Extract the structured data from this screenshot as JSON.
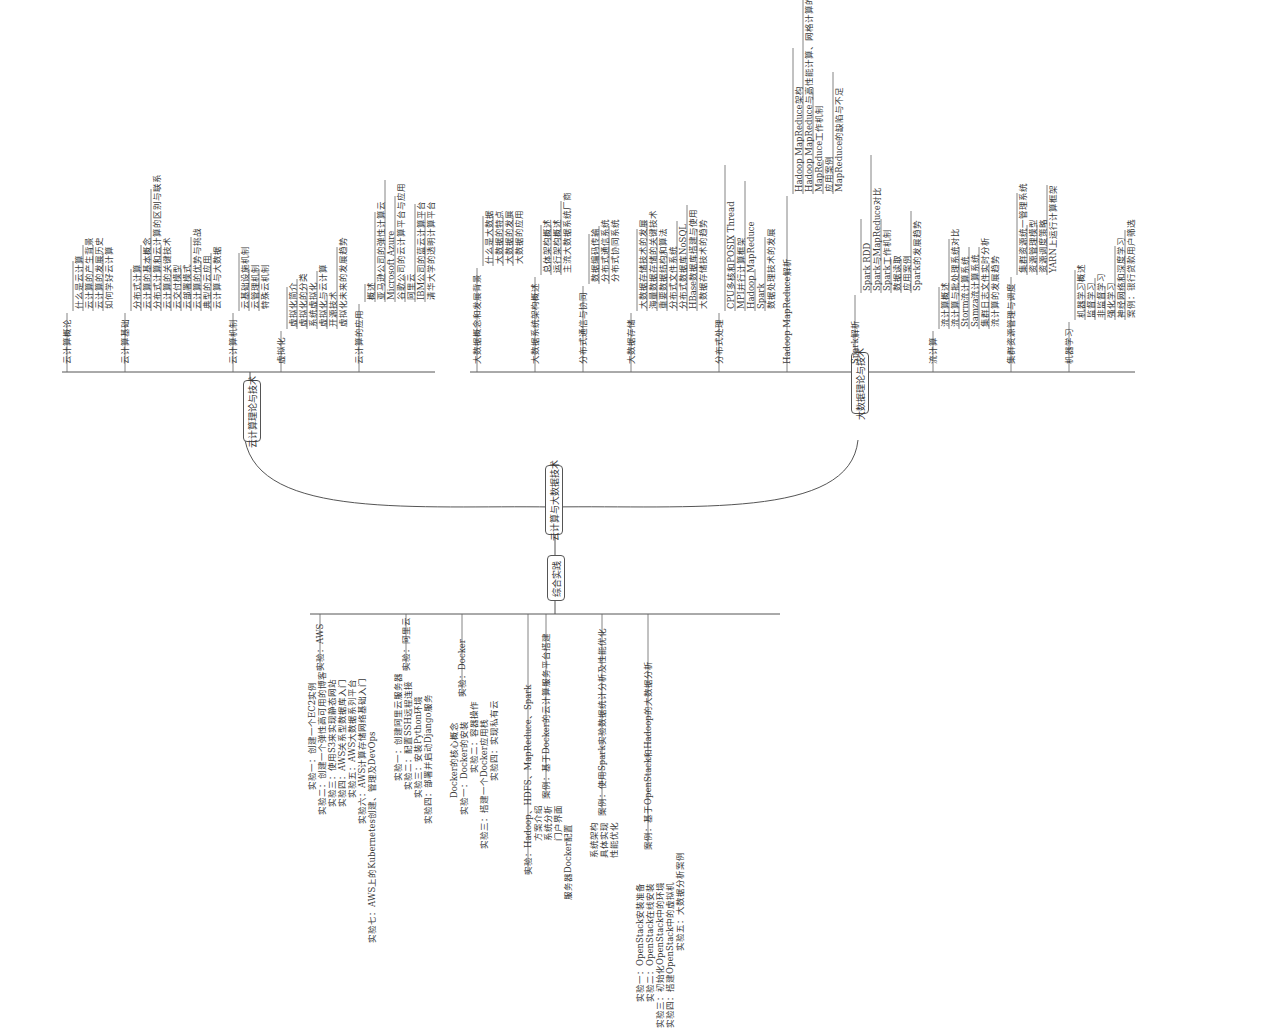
{
  "root": {
    "label": "云计算与大数据技术"
  },
  "left_hub": {
    "label": "云计算理论与技术"
  },
  "right_hub": {
    "label": "大数据理论与技术"
  },
  "bottom_hub": {
    "label": "综合实践"
  },
  "cloud_theory": [
    {
      "label": "云计算概论",
      "children": [
        "什么是云计算",
        "云计算的产生背景",
        "云计算的发展历史",
        "如何学好云计算"
      ]
    },
    {
      "label": "云计算基础",
      "children": [
        "分布式计算",
        "云计算的基本概念",
        "分布式计算和云计算的区别与联系",
        "云计算的关键技术",
        "云交付模型",
        "云部署模式",
        "云计算的优势与挑战",
        "典型的云应用",
        "云计算与大数据"
      ]
    },
    {
      "label": "云计算机制",
      "children": [
        "云基础设施机制",
        "云管理机制",
        "特殊云机制"
      ]
    },
    {
      "label": "虚拟化",
      "children": [
        "虚拟化简介",
        "虚拟化的分类",
        "系统虚拟化",
        "虚拟化与云计算",
        "开源技术",
        "虚拟化未来的发展趋势"
      ]
    },
    {
      "label": "云计算的应用",
      "children": [
        "概述",
        "亚马逊公司的弹性计算云",
        "Microsoft Azure",
        "谷歌公司的云计算平台与应用",
        "阿里云",
        "IBM公司的蓝云计算平台",
        "清华大学的透明计算平台"
      ]
    }
  ],
  "bigdata_theory": [
    {
      "label": "大数据概念和发展背景",
      "children": [
        "什么是大数据",
        "大数据的特点",
        "大数据的发展",
        "大数据的应用"
      ]
    },
    {
      "label": "大数据系统架构概述",
      "children": [
        "总体架构概述",
        "运行架构概述",
        "主流大数据系统厂商"
      ]
    },
    {
      "label": "分布式通信与协同",
      "children": [
        "数据编码传输",
        "分布式通信系统",
        "分布式协同系统"
      ]
    },
    {
      "label": "大数据存储",
      "children": [
        "大数据存储技术的发展",
        "海量数据存储的关键技术",
        "重要数据结构和算法",
        "分布式文件系统",
        "分布式数据库NoSQL",
        "HBase数据库搭建与使用",
        "大数据存储技术的趋势"
      ]
    },
    {
      "label": "分布式处理",
      "children": [
        "CPU多核和POSIX Thread",
        "MPI并行计算框架",
        "Hadoop MapReduce",
        "Spark",
        "数据处理技术的发展"
      ]
    },
    {
      "label": "Hadoop MapReduce解析",
      "children": [
        "Hadoop MapReduce架构",
        "Hadoop MapReduce与高性能计算、网格计算的区别",
        "MapReduce工作机制",
        "应用案例",
        "MapReduce的缺陷与不足"
      ]
    },
    {
      "label": "Spark解析",
      "children": [
        "Spark RDD",
        "Spark与MapReduce对比",
        "Spark工作机制",
        "数据读取",
        "应用案例",
        "Spark的发展趋势"
      ]
    },
    {
      "label": "流计算",
      "children": [
        "流计算概述",
        "流计算与批处理系统对比",
        "Storm流计算系统",
        "Samza流计算系统",
        "集群日志文件实时分析",
        "流计算的发展趋势"
      ]
    },
    {
      "label": "集群资源管理与调度",
      "children": [
        "集群资源统一管理系统",
        "资源管理模型",
        "资源调度策略",
        "YARN上运行计算框架"
      ]
    },
    {
      "label": "机器学习",
      "children": [
        "机器学习概述",
        "监督学习",
        "非监督学习",
        "强化学习",
        "神经网络和深度学习",
        "案例：银行贷款用户筛选"
      ]
    }
  ],
  "practice": [
    {
      "label": "实验：AWS",
      "children": [
        "实验一：创建一个EC2实例",
        "实验二：创建一个弹性高可用的博客",
        "实验三：使用S3来实现静态网站",
        "实验四：AWS关系型数据库入门",
        "实验五：AWS大数据系列平台",
        "实验六：AWS计算存储网络基础入门",
        "实验七：AWS上的Kubernetes创建、管理及DevOps"
      ]
    },
    {
      "label": "实验：阿里云",
      "children": [
        "实验一：创建阿里云服务器",
        "实验二：配置SSH远程连接",
        "实验三：安装Python环境",
        "实验四：部署并启动Django服务"
      ]
    },
    {
      "label": "实验：Docker",
      "children": [
        "Docker的核心概念",
        "实验一：Docker的安装",
        "实验二：容器操作",
        "实验三：搭建一个Docker应用栈",
        "实验四：实现私有云"
      ]
    },
    {
      "label": "实验：Hadoop、HDFS、MapReduce、Spark",
      "children": []
    },
    {
      "label": "案例：基于Docker的云计算服务平台搭建",
      "children": [
        "方案介绍",
        "系统分析",
        "门户界面",
        "服务器Docker配置"
      ]
    },
    {
      "label": "案例：使用Spark实验数据统计分析及性能优化",
      "children": [
        "系统架构",
        "具体实现",
        "性能优化"
      ]
    },
    {
      "label": "案例：基于OpenStack和Hadoop的大数据分析",
      "children": [
        "实验一：OpenStack安装准备",
        "实验二：OpenStack在线安装",
        "实验三：初始化OpenStack中的环境",
        "实验四：搭建OpenStack中的虚拟机",
        "实验五：大数据分析案例"
      ]
    }
  ]
}
